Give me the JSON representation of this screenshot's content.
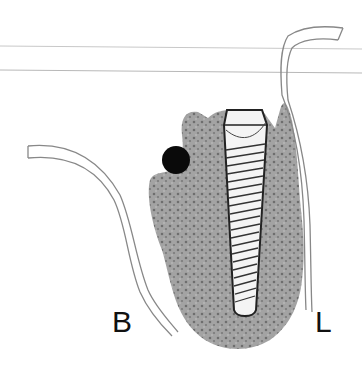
{
  "labels": {
    "buccal": "B",
    "lingual": "L"
  },
  "colors": {
    "bone": "#9a9a9a",
    "outline": "#777777",
    "implant_line": "#222222",
    "nerve": "#0a0a0a",
    "guide_line": "#bdbdbd"
  }
}
